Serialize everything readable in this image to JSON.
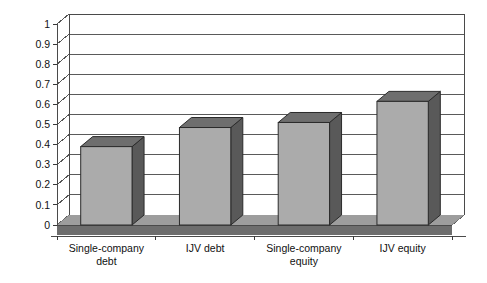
{
  "chart_data": {
    "type": "bar",
    "title": "",
    "subtitle": "",
    "xlabel": "",
    "ylabel": "",
    "categories": [
      "Single-company debt",
      "IJV debt",
      "Single-company equity",
      "IJV equity"
    ],
    "category_lines": [
      [
        "Single-company",
        "debt"
      ],
      [
        "IJV debt",
        ""
      ],
      [
        "Single-company",
        "equity"
      ],
      [
        "IJV equity",
        ""
      ]
    ],
    "values": [
      0.39,
      0.485,
      0.51,
      0.615
    ],
    "series": [
      {
        "name": "Series 1",
        "values": [
          0.39,
          0.485,
          0.51,
          0.615
        ]
      }
    ],
    "ylim": [
      0,
      1
    ],
    "ytick_step": 0.1,
    "ytick_labels": [
      "1",
      "0.9",
      "0.8",
      "0.7",
      "0.6",
      "0.5",
      "0.4",
      "0.3",
      "0.2",
      "0.1",
      "0"
    ],
    "ytick_values": [
      1,
      0.9,
      0.8,
      0.7,
      0.6,
      0.5,
      0.4,
      0.3,
      0.2,
      0.1,
      0
    ],
    "grid": true,
    "grid_axis": "y",
    "legend": false,
    "legend_position": "none",
    "three_d": true,
    "annotations": []
  },
  "style": {
    "background": "#ffffff",
    "bar_front_color": "#ababab",
    "bar_side_color": "#595959",
    "bar_top_color": "#6e6e6e",
    "floor_top_color": "#9d9d9d",
    "floor_front_color": "#6d6d6d",
    "grid_color": "#5a5a5a",
    "axis_color": "#4a4a4a",
    "text_color": "#111111"
  }
}
